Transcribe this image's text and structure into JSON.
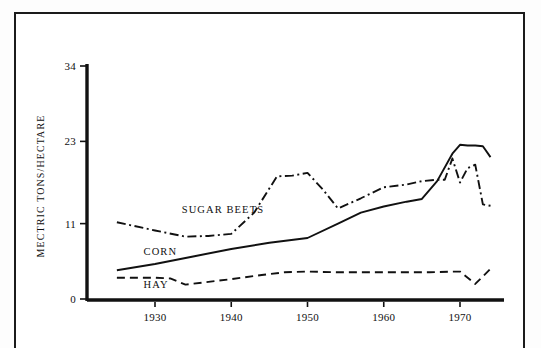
{
  "chart_data": {
    "type": "line",
    "title": "",
    "subtitle": "",
    "xlabel": "",
    "ylabel": "MECTRIC TONS/HECTARE",
    "xlim": [
      1925,
      1975
    ],
    "ylim": [
      0,
      34
    ],
    "grid": false,
    "legend_position": "inline-annotations",
    "y_ticks": [
      "0",
      "11",
      "23",
      "34"
    ],
    "y_tick_values": [
      0,
      11,
      23,
      34
    ],
    "x_ticks": [
      "1930",
      "1940",
      "1950",
      "1960",
      "1970"
    ],
    "x_tick_values": [
      1930,
      1940,
      1950,
      1960,
      1970
    ],
    "series": [
      {
        "name": "SUGAR BEETS",
        "style": "dash-dot",
        "color": "#111111",
        "label_x": 1933.5,
        "label_y": 12.6,
        "x": [
          1925,
          1930,
          1934,
          1937,
          1940,
          1943,
          1946,
          1948,
          1950,
          1952,
          1954,
          1957,
          1960,
          1963,
          1965,
          1967,
          1968,
          1969,
          1970,
          1971,
          1972,
          1973,
          1974
        ],
        "y": [
          11.2,
          10.0,
          9.1,
          9.2,
          9.5,
          12.6,
          17.9,
          18.0,
          18.4,
          16.0,
          13.2,
          14.7,
          16.3,
          16.7,
          17.2,
          17.4,
          17.4,
          20.5,
          17.0,
          19.1,
          19.6,
          13.8,
          13.6
        ]
      },
      {
        "name": "CORN",
        "style": "solid",
        "color": "#111111",
        "label_x": 1928.5,
        "label_y": 6.4,
        "x": [
          1925,
          1930,
          1935,
          1940,
          1945,
          1950,
          1954,
          1957,
          1960,
          1963,
          1965,
          1967,
          1969,
          1970,
          1971,
          1972,
          1973,
          1974
        ],
        "y": [
          4.2,
          5.1,
          6.2,
          7.3,
          8.2,
          8.9,
          11.0,
          12.6,
          13.5,
          14.2,
          14.6,
          17.2,
          21.2,
          22.5,
          22.4,
          22.4,
          22.3,
          20.7
        ]
      },
      {
        "name": "HAY",
        "style": "dashed",
        "color": "#111111",
        "label_x": 1928.5,
        "label_y": 1.6,
        "x": [
          1925,
          1930,
          1932,
          1934,
          1937,
          1940,
          1944,
          1947,
          1950,
          1954,
          1958,
          1962,
          1966,
          1969,
          1970,
          1972,
          1974
        ],
        "y": [
          3.1,
          3.1,
          3.0,
          2.1,
          2.5,
          2.9,
          3.5,
          3.9,
          4.0,
          3.9,
          3.9,
          3.9,
          3.9,
          4.0,
          4.0,
          2.2,
          4.4
        ]
      }
    ]
  },
  "figure": {
    "border_color": "#1b1b1b",
    "background": "#ffffff"
  }
}
